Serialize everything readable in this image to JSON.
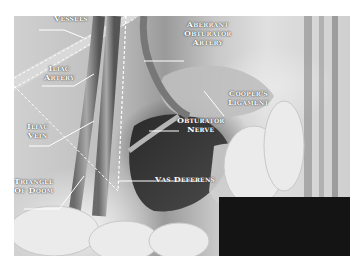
{
  "figure": {
    "style": "grayscale illustration",
    "labels": [
      {
        "id": "epigastric-vessels",
        "text": "Vessels",
        "x": 30,
        "y": 17
      },
      {
        "id": "iliac-artery",
        "text": "Iliac\nArtery",
        "x": 42,
        "y": 64
      },
      {
        "id": "iliac-vein",
        "text": "Iliac\nVein",
        "x": 27,
        "y": 123
      },
      {
        "id": "triangle-of-doom",
        "text": "Triangle\nOf Doom",
        "x": 12,
        "y": 176
      },
      {
        "id": "aberrant-obturator-artery",
        "text": "Aberrant\nObturator\nArtery",
        "x": 184,
        "y": 20
      },
      {
        "id": "coopers-ligament",
        "text": "Cooper's\nLigament",
        "x": 228,
        "y": 89
      },
      {
        "id": "obturator-nerve",
        "text": "Obturator\nNerve",
        "x": 178,
        "y": 116
      },
      {
        "id": "vas-deferens",
        "text": "Vas Deferens",
        "x": 155,
        "y": 175
      }
    ],
    "redaction_box": {
      "color": "#141414"
    }
  }
}
